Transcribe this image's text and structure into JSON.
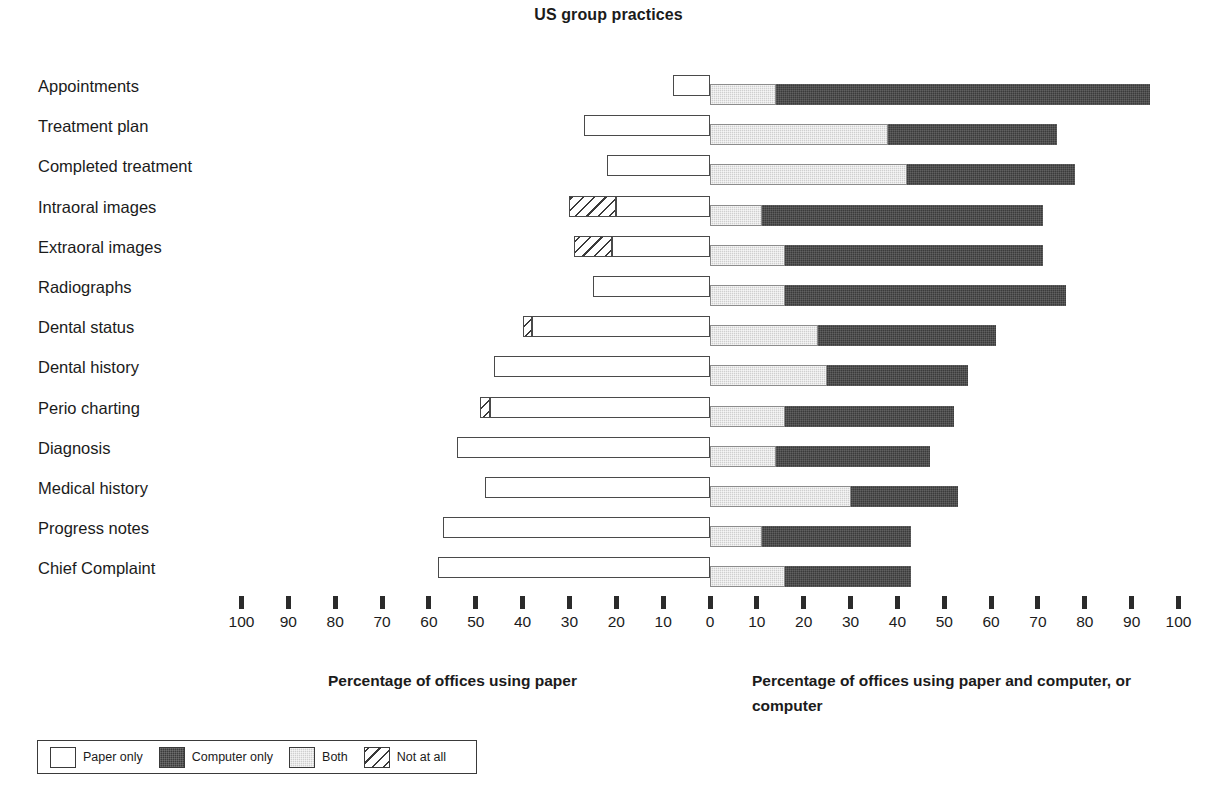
{
  "chart_data": {
    "type": "bar",
    "title": "US group practices",
    "subtitle": "",
    "orientation": "horizontal-diverging",
    "xlabel_left": "Percentage of offices using paper",
    "xlabel_right": "Percentage of offices using paper and computer, or computer",
    "ylabel": "",
    "grid": false,
    "legend_position": "bottom-left",
    "axis": {
      "left_ticks": [
        100,
        90,
        80,
        70,
        60,
        50,
        40,
        30,
        20,
        10
      ],
      "center_tick": 0,
      "right_ticks": [
        10,
        20,
        30,
        40,
        50,
        60,
        70,
        80,
        90,
        100
      ],
      "tick_labels": [
        "100",
        "90",
        "80",
        "70",
        "60",
        "50",
        "40",
        "30",
        "20",
        "10",
        "0",
        "10",
        "20",
        "30",
        "40",
        "50",
        "60",
        "70",
        "80",
        "90",
        "100"
      ],
      "xlim_left": [
        0,
        100
      ],
      "xlim_right": [
        0,
        100
      ],
      "units": "percent"
    },
    "legend": [
      {
        "key": "paper_only",
        "label": "Paper only",
        "color": "#ffffff",
        "pattern": "solid-outline"
      },
      {
        "key": "computer_only",
        "label": "Computer only",
        "color": "#3b3b3b",
        "pattern": "dark-fill"
      },
      {
        "key": "both",
        "label": "Both",
        "color": "#cfcfcf",
        "pattern": "light-grey-fill"
      },
      {
        "key": "not_at_all",
        "label": "Not at all",
        "color": "#ffffff",
        "pattern": "diagonal-hatch"
      }
    ],
    "categories": [
      "Appointments",
      "Treatment plan",
      "Completed treatment",
      "Intraoral images",
      "Extraoral images",
      "Radiographs",
      "Dental status",
      "Dental history",
      "Perio charting",
      "Diagnosis",
      "Medical history",
      "Progress notes",
      "Chief Complaint"
    ],
    "series": [
      {
        "name": "Paper only",
        "side": "left",
        "values": [
          8,
          27,
          22,
          20,
          21,
          25,
          38,
          46,
          47,
          54,
          48,
          57,
          58
        ]
      },
      {
        "name": "Not at all",
        "side": "left",
        "values": [
          0,
          0,
          0,
          30,
          29,
          0,
          40,
          0,
          49,
          0,
          0,
          0,
          0
        ]
      },
      {
        "name": "Both",
        "side": "right",
        "values": [
          14,
          38,
          42,
          11,
          16,
          16,
          23,
          25,
          16,
          14,
          30,
          11,
          16
        ]
      },
      {
        "name": "Computer only",
        "side": "right",
        "values": [
          94,
          74,
          78,
          71,
          71,
          76,
          61,
          55,
          52,
          47,
          53,
          43,
          43
        ]
      }
    ],
    "rows": [
      {
        "category": "Appointments",
        "paper_only": 8,
        "not_at_all": 0,
        "both": 14,
        "computer_only": 94
      },
      {
        "category": "Treatment plan",
        "paper_only": 27,
        "not_at_all": 0,
        "both": 38,
        "computer_only": 74
      },
      {
        "category": "Completed treatment",
        "paper_only": 22,
        "not_at_all": 0,
        "both": 42,
        "computer_only": 78
      },
      {
        "category": "Intraoral images",
        "paper_only": 20,
        "not_at_all": 30,
        "both": 11,
        "computer_only": 71
      },
      {
        "category": "Extraoral images",
        "paper_only": 21,
        "not_at_all": 29,
        "both": 16,
        "computer_only": 71
      },
      {
        "category": "Radiographs",
        "paper_only": 25,
        "not_at_all": 0,
        "both": 16,
        "computer_only": 76
      },
      {
        "category": "Dental status",
        "paper_only": 38,
        "not_at_all": 40,
        "both": 23,
        "computer_only": 61
      },
      {
        "category": "Dental history",
        "paper_only": 46,
        "not_at_all": 0,
        "both": 25,
        "computer_only": 55
      },
      {
        "category": "Perio charting",
        "paper_only": 47,
        "not_at_all": 49,
        "both": 16,
        "computer_only": 52
      },
      {
        "category": "Diagnosis",
        "paper_only": 54,
        "not_at_all": 0,
        "both": 14,
        "computer_only": 47
      },
      {
        "category": "Medical history",
        "paper_only": 48,
        "not_at_all": 0,
        "both": 30,
        "computer_only": 53
      },
      {
        "category": "Progress notes",
        "paper_only": 57,
        "not_at_all": 0,
        "both": 11,
        "computer_only": 43
      },
      {
        "category": "Chief Complaint",
        "paper_only": 58,
        "not_at_all": 0,
        "both": 16,
        "computer_only": 43
      }
    ]
  },
  "colors": {
    "paper_only": "#ffffff",
    "computer_only": "#3b3b3b",
    "both": "#cfcfcf",
    "not_at_all": "#ffffff",
    "outline": "#3a3a3a",
    "text": "#1b1b1b",
    "background": "#ffffff"
  }
}
